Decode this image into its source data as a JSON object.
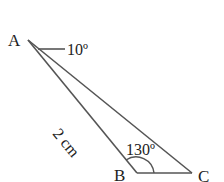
{
  "diagram": {
    "vertices": {
      "A": {
        "label": "A"
      },
      "B": {
        "label": "B"
      },
      "C": {
        "label": "C"
      }
    },
    "angle_A_label": "10º",
    "angle_B_label": "130º",
    "side_AB_label": "2 cm",
    "line_color": "#555555"
  }
}
